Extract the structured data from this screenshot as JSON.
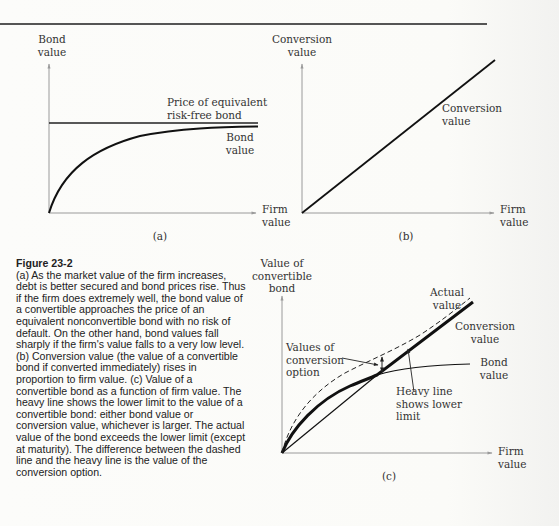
{
  "figure": {
    "number": "Figure 23-2",
    "caption": "(a) As the market value of the firm increases, debt is better secured and bond prices rise. Thus if the firm does extremely well, the bond value of a convertible approaches the price of an equivalent nonconvertible bond with no risk of default. On the other hand, bond values fall sharply if the firm's value falls to a very low level. (b) Conversion value (the value of a convertible bond if converted immediately) rises in proportion to firm value. (c) Value of a convertible bond as a function of firm value. The heavy line shows the lower limit to the value of a convertible bond: either bond value or conversion value, whichever is larger. The actual value of the bond exceeds the lower limit (except at maturity). The difference between the dashed line and the heavy line is the value of the conversion option."
  },
  "panels": {
    "a": {
      "tag": "(a)",
      "y_label_1": "Bond",
      "y_label_2": "value",
      "x_label_1": "Firm",
      "x_label_2": "value",
      "riskfree_label_1": "Price of equivalent",
      "riskfree_label_2": "risk-free bond",
      "bond_label_1": "Bond",
      "bond_label_2": "value"
    },
    "b": {
      "tag": "(b)",
      "y_label_1": "Conversion",
      "y_label_2": "value",
      "x_label_1": "Firm",
      "x_label_2": "value",
      "line_label_1": "Conversion",
      "line_label_2": "value"
    },
    "c": {
      "tag": "(c)",
      "y_label_1": "Value of",
      "y_label_2": "convertible",
      "y_label_3": "bond",
      "x_label_1": "Firm",
      "x_label_2": "value",
      "actual_label_1": "Actual",
      "actual_label_2": "value",
      "conversion_label_1": "Conversion",
      "conversion_label_2": "value",
      "bond_label_1": "Bond",
      "bond_label_2": "value",
      "option_label_1": "Values of",
      "option_label_2": "conversion",
      "option_label_3": "option",
      "heavy_label_1": "Heavy line",
      "heavy_label_2": "shows lower",
      "heavy_label_3": "limit"
    }
  },
  "colors": {
    "axis": "#9a9a9a",
    "curve": "#111111",
    "text": "#2a2a2a",
    "background": "#fbfbf9"
  }
}
